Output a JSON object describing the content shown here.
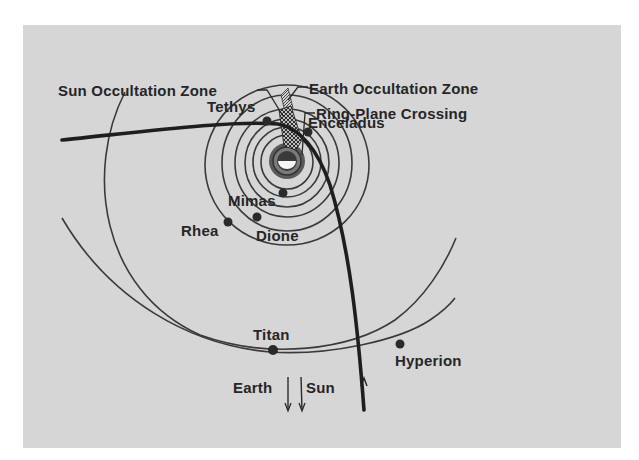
{
  "figure": {
    "type": "orbital-trajectory-diagram",
    "colors": {
      "background": "#d6d6d6",
      "ink": "#262626",
      "page": "#ffffff"
    }
  },
  "labels": {
    "sun_occultation_zone": "Sun Occultation Zone",
    "earth_occultation_zone": "Earth Occultation Zone",
    "ring_plane_crossing": "Ring-Plane Crossing",
    "tethys": "Tethys",
    "enceladus": "Enceladus",
    "mimas": "Mimas",
    "rhea": "Rhea",
    "dione": "Dione",
    "titan": "Titan",
    "hyperion": "Hyperion",
    "earth": "Earth",
    "sun": "Sun"
  },
  "moons": [
    {
      "name": "Mimas",
      "x": 283,
      "y": 193
    },
    {
      "name": "Enceladus",
      "x": 308,
      "y": 132
    },
    {
      "name": "Tethys",
      "x": 267,
      "y": 121
    },
    {
      "name": "Dione",
      "x": 257,
      "y": 217
    },
    {
      "name": "Rhea",
      "x": 228,
      "y": 222
    },
    {
      "name": "Titan",
      "x": 273,
      "y": 350
    },
    {
      "name": "Hyperion",
      "x": 400,
      "y": 344
    }
  ],
  "directions": [
    {
      "name": "Earth",
      "arrow": "down"
    },
    {
      "name": "Sun",
      "arrow": "down"
    }
  ]
}
